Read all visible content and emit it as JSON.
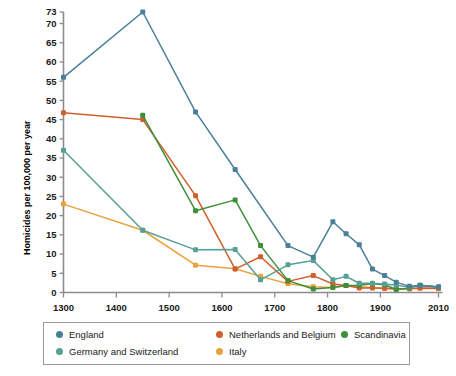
{
  "chart_data": {
    "type": "line",
    "title": "",
    "xlabel": "",
    "ylabel": "Homicides per 100,000 per year",
    "xlim": [
      1300,
      2010
    ],
    "ylim": [
      0,
      73
    ],
    "grid": false,
    "legend_position": "bottom",
    "x_ticks": [
      1300,
      1400,
      1500,
      1600,
      1700,
      1800,
      1900,
      2010
    ],
    "x_tick_labels": [
      "1300",
      "1400",
      "1500",
      "1600",
      "1700",
      "1800",
      "1900",
      "2010"
    ],
    "y_ticks": [
      0,
      5,
      10,
      15,
      20,
      25,
      30,
      35,
      40,
      45,
      50,
      55,
      60,
      65,
      70,
      73
    ],
    "y_tick_labels": [
      "0",
      "5",
      "10",
      "15",
      "20",
      "25",
      "30",
      "35",
      "40",
      "45",
      "50",
      "55",
      "60",
      "65",
      "70",
      "73"
    ],
    "series": [
      {
        "name": "England",
        "color": "#4a7f99",
        "points": [
          [
            1300,
            56.0
          ],
          [
            1450,
            73.0
          ],
          [
            1550,
            47.0
          ],
          [
            1625,
            32.0
          ],
          [
            1725,
            12.2
          ],
          [
            1773,
            9.2
          ],
          [
            1810,
            18.4
          ],
          [
            1835,
            15.3
          ],
          [
            1860,
            12.4
          ],
          [
            1885,
            6.1
          ],
          [
            1908,
            4.4
          ],
          [
            1930,
            2.7
          ],
          [
            1955,
            1.6
          ],
          [
            1975,
            1.8
          ],
          [
            2010,
            1.4
          ]
        ]
      },
      {
        "name": "Germany and Switzerland",
        "color": "#57a096",
        "points": [
          [
            1300,
            37.0
          ],
          [
            1450,
            16.2
          ],
          [
            1550,
            11.1
          ],
          [
            1625,
            11.2
          ],
          [
            1673,
            3.3
          ],
          [
            1725,
            7.2
          ],
          [
            1773,
            8.3
          ],
          [
            1810,
            3.3
          ],
          [
            1835,
            4.2
          ],
          [
            1860,
            2.4
          ],
          [
            1885,
            2.4
          ],
          [
            1908,
            2.2
          ],
          [
            1930,
            1.9
          ],
          [
            1955,
            1.4
          ],
          [
            1975,
            1.9
          ],
          [
            2010,
            1.4
          ]
        ]
      },
      {
        "name": "Netherlands and Belgium",
        "color": "#cf5f2c",
        "points": [
          [
            1300,
            46.8
          ],
          [
            1450,
            45.0
          ],
          [
            1550,
            25.2
          ],
          [
            1625,
            6.1
          ],
          [
            1673,
            9.3
          ],
          [
            1725,
            2.9
          ],
          [
            1773,
            4.4
          ],
          [
            1810,
            2.2
          ],
          [
            1835,
            1.8
          ],
          [
            1860,
            1.2
          ],
          [
            1885,
            1.2
          ],
          [
            1908,
            1.1
          ],
          [
            1930,
            0.9
          ],
          [
            1955,
            1.0
          ],
          [
            1975,
            1.2
          ],
          [
            2010,
            1.1
          ]
        ]
      },
      {
        "name": "Italy",
        "color": "#e9a23b",
        "points": [
          [
            1300,
            23.0
          ],
          [
            1450,
            16.2
          ],
          [
            1550,
            7.1
          ],
          [
            1625,
            6.2
          ],
          [
            1673,
            4.2
          ],
          [
            1725,
            2.3
          ],
          [
            1773,
            1.5
          ],
          [
            1810,
            1.3
          ],
          [
            1835,
            1.8
          ],
          [
            1860,
            1.5
          ],
          [
            1885,
            1.3
          ],
          [
            1908,
            1.1
          ],
          [
            1930,
            0.9
          ],
          [
            1955,
            1.0
          ],
          [
            1975,
            1.1
          ],
          [
            2010,
            1.0
          ]
        ]
      },
      {
        "name": "Scandinavia",
        "color": "#3f8f3a",
        "points": [
          [
            1450,
            46.1
          ],
          [
            1550,
            21.3
          ],
          [
            1625,
            24.1
          ],
          [
            1673,
            12.2
          ],
          [
            1725,
            3.1
          ],
          [
            1773,
            0.9
          ],
          [
            1810,
            1.3
          ],
          [
            1835,
            1.8
          ],
          [
            1860,
            1.9
          ],
          [
            1885,
            2.3
          ],
          [
            1908,
            2.0
          ],
          [
            1930,
            0.8
          ],
          [
            1955,
            1.2
          ],
          [
            1975,
            1.9
          ],
          [
            2010,
            1.4
          ]
        ]
      }
    ]
  },
  "legend": {
    "entries": [
      {
        "label": "England",
        "color": "#4a7f99"
      },
      {
        "label": "Netherlands and Belgium",
        "color": "#cf5f2c"
      },
      {
        "label": "Scandinavia",
        "color": "#3f8f3a"
      },
      {
        "label": "Germany and Switzerland",
        "color": "#57a096"
      },
      {
        "label": "Italy",
        "color": "#e9a23b"
      }
    ]
  }
}
